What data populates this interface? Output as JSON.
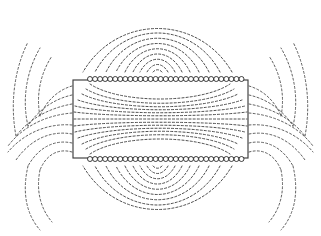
{
  "figure": {
    "kind": "magnetic-field-line-diagram",
    "width": 321,
    "height": 236,
    "background_color": "#ffffff",
    "caption": "",
    "title": ""
  },
  "colors": {
    "background": "#ffffff",
    "field_line": "#3a3a3a",
    "field_line_outer": "#444444",
    "core_outline": "#3d3d3d",
    "coil_ring_stroke": "#1e1e1e",
    "coil_ring_fill": "#ffffff"
  },
  "core": {
    "label": "rectangular core",
    "x": 73,
    "y": 80,
    "width": 175,
    "height": 78,
    "stroke_width": 1.15
  },
  "coils": {
    "label": "coil winding cross sections",
    "ring_radius": 2.5,
    "ring_spacing": 5.05,
    "count_per_row": 31,
    "start_x": 90,
    "top_row_y": 79,
    "bottom_row_y": 159
  },
  "chart_data": {
    "type": "line",
    "title": "",
    "xlabel": "",
    "ylabel": "",
    "xlim": [
      0,
      321
    ],
    "ylim": [
      0,
      236
    ],
    "grid": false,
    "legend": "none",
    "series": [
      {
        "name": "top-arc-1",
        "group": "upper-loops",
        "path": "M 162,72 C 159,69 156,69 153,72"
      },
      {
        "name": "top-arc-2",
        "group": "upper-loops",
        "path": "M 168,72 C 162,62 153,62 147,72"
      },
      {
        "name": "top-arc-3",
        "group": "upper-loops",
        "path": "M 175,72 C 166,55 149,55 140,72"
      },
      {
        "name": "top-arc-4",
        "group": "upper-loops",
        "path": "M 182,72 C 170,48 145,48 133,72"
      },
      {
        "name": "top-arc-5",
        "group": "upper-loops",
        "path": "M 190,72 C 175,41 140,41 125,72"
      },
      {
        "name": "top-arc-6",
        "group": "upper-loops",
        "path": "M 199,72 C 180,34 135,34 116,72"
      },
      {
        "name": "top-arc-7",
        "group": "upper-loops",
        "path": "M 209,72 C 186,27 129,27 106,72"
      },
      {
        "name": "top-arc-8",
        "group": "upper-loops",
        "path": "M 220,72 C 192,20 123,20 95,72"
      },
      {
        "name": "top-arc-9",
        "group": "upper-loops",
        "path": "M 232,72 C 198,14 117,14 83,72"
      },
      {
        "name": "bot-arc-1",
        "group": "lower-loops",
        "path": "M 162,166 C 159,169 156,169 153,166"
      },
      {
        "name": "bot-arc-2",
        "group": "lower-loops",
        "path": "M 168,166 C 162,176 153,176 147,166"
      },
      {
        "name": "bot-arc-3",
        "group": "lower-loops",
        "path": "M 175,166 C 166,183 149,183 140,166"
      },
      {
        "name": "bot-arc-4",
        "group": "lower-loops",
        "path": "M 182,166 C 170,190 145,190 133,166"
      },
      {
        "name": "bot-arc-5",
        "group": "lower-loops",
        "path": "M 190,166 C 175,197 140,197 125,166"
      },
      {
        "name": "bot-arc-6",
        "group": "lower-loops",
        "path": "M 199,166 C 180,204 135,204 116,166"
      },
      {
        "name": "bot-arc-7",
        "group": "lower-loops",
        "path": "M 209,166 C 186,211 129,211 106,166"
      },
      {
        "name": "bot-arc-8",
        "group": "lower-loops",
        "path": "M 220,166 C 192,218 123,218 95,166"
      },
      {
        "name": "bot-arc-9",
        "group": "lower-loops",
        "path": "M 232,166 C 198,224 117,224 83,166"
      },
      {
        "name": "inner-1",
        "group": "core-interior",
        "path": "M 90,84 C 120,104 200,104 230,84"
      },
      {
        "name": "inner-2",
        "group": "core-interior",
        "path": "M 86,89 C 118,108 202,108 234,89"
      },
      {
        "name": "inner-3",
        "group": "core-interior",
        "path": "M 82,94 C 116,111 204,111 238,94"
      },
      {
        "name": "inner-4",
        "group": "core-interior",
        "path": "M 78,100 C 114,113 206,113 242,100"
      },
      {
        "name": "inner-5",
        "group": "core-interior",
        "path": "M 75,106 C 112,115 208,115 245,106"
      },
      {
        "name": "inner-6",
        "group": "core-interior",
        "path": "M 74,112 C 112,117 208,117 247,112"
      },
      {
        "name": "inner-7",
        "group": "core-interior",
        "path": "M 74,119 C 112,119 208,119 247,119"
      },
      {
        "name": "inner-8",
        "group": "core-interior",
        "path": "M 74,126 C 112,121 208,121 247,126"
      },
      {
        "name": "inner-9",
        "group": "core-interior",
        "path": "M 75,132 C 112,123 208,123 245,132"
      },
      {
        "name": "inner-10",
        "group": "core-interior",
        "path": "M 78,138 C 114,125 206,125 242,138"
      },
      {
        "name": "inner-11",
        "group": "core-interior",
        "path": "M 82,144 C 116,127 204,127 238,144"
      },
      {
        "name": "inner-12",
        "group": "core-interior",
        "path": "M 86,149 C 118,130 202,130 234,149"
      },
      {
        "name": "inner-13",
        "group": "core-interior",
        "path": "M 90,154 C 120,134 200,134 230,154"
      },
      {
        "name": "left-fan-1",
        "group": "left-fringe",
        "path": "M 72,86 C 58,90 46,101 40,116"
      },
      {
        "name": "left-fan-2",
        "group": "left-fringe",
        "path": "M 72,95 C 54,99 38,110 28,126"
      },
      {
        "name": "left-fan-3",
        "group": "left-fringe",
        "path": "M 72,104 C 50,108 30,118 16,136"
      },
      {
        "name": "left-fan-4",
        "group": "left-fringe",
        "path": "M 72,113 C 48,115 24,125 8,146"
      },
      {
        "name": "left-fan-5",
        "group": "left-fringe",
        "path": "M 72,125 C 48,123 24,133 8,152"
      },
      {
        "name": "left-fan-6",
        "group": "left-fringe",
        "path": "M 72,134 C 50,130 30,140 16,160"
      },
      {
        "name": "left-fan-7",
        "group": "left-fringe",
        "path": "M 72,143 C 54,139 38,148 28,166"
      },
      {
        "name": "left-fan-8",
        "group": "left-fringe",
        "path": "M 72,152 C 58,148 46,155 40,170"
      },
      {
        "name": "left-up-1",
        "group": "left-fringe-upper",
        "path": "M 40,116 C 36,96 40,74 52,56"
      },
      {
        "name": "left-up-2",
        "group": "left-fringe-upper",
        "path": "M 28,126 C 22,100 26,72 40,48"
      },
      {
        "name": "left-up-3",
        "group": "left-fringe-upper",
        "path": "M 16,136 C 10,104 14,70 28,42"
      },
      {
        "name": "left-dn-1",
        "group": "left-fringe-lower",
        "path": "M 40,170 C 36,190 40,208 52,222"
      },
      {
        "name": "left-dn-2",
        "group": "left-fringe-lower",
        "path": "M 28,166 C 22,192 26,214 40,230"
      },
      {
        "name": "right-fan-1",
        "group": "right-fringe",
        "path": "M 249,86 C 263,90 275,101 281,116"
      },
      {
        "name": "right-fan-2",
        "group": "right-fringe",
        "path": "M 249,95 C 267,99 283,110 293,126"
      },
      {
        "name": "right-fan-3",
        "group": "right-fringe",
        "path": "M 249,104 C 271,108 291,118 305,136"
      },
      {
        "name": "right-fan-4",
        "group": "right-fringe",
        "path": "M 249,113 C 273,115 297,125 313,146"
      },
      {
        "name": "right-fan-5",
        "group": "right-fringe",
        "path": "M 249,125 C 273,123 297,133 313,152"
      },
      {
        "name": "right-fan-6",
        "group": "right-fringe",
        "path": "M 249,134 C 271,130 291,140 305,160"
      },
      {
        "name": "right-fan-7",
        "group": "right-fringe",
        "path": "M 249,143 C 267,139 283,148 293,166"
      },
      {
        "name": "right-fan-8",
        "group": "right-fringe",
        "path": "M 249,152 C 263,148 275,155 281,170"
      },
      {
        "name": "right-up-1",
        "group": "right-fringe-upper",
        "path": "M 281,116 C 285,96 281,74 269,56"
      },
      {
        "name": "right-up-2",
        "group": "right-fringe-upper",
        "path": "M 293,126 C 299,100 295,72 281,48"
      },
      {
        "name": "right-up-3",
        "group": "right-fringe-upper",
        "path": "M 305,136 C 311,104 307,70 293,42"
      },
      {
        "name": "right-dn-1",
        "group": "right-fringe-lower",
        "path": "M 281,170 C 285,190 281,208 269,222"
      },
      {
        "name": "right-dn-2",
        "group": "right-fringe-lower",
        "path": "M 293,166 C 299,192 295,214 281,230"
      }
    ]
  }
}
